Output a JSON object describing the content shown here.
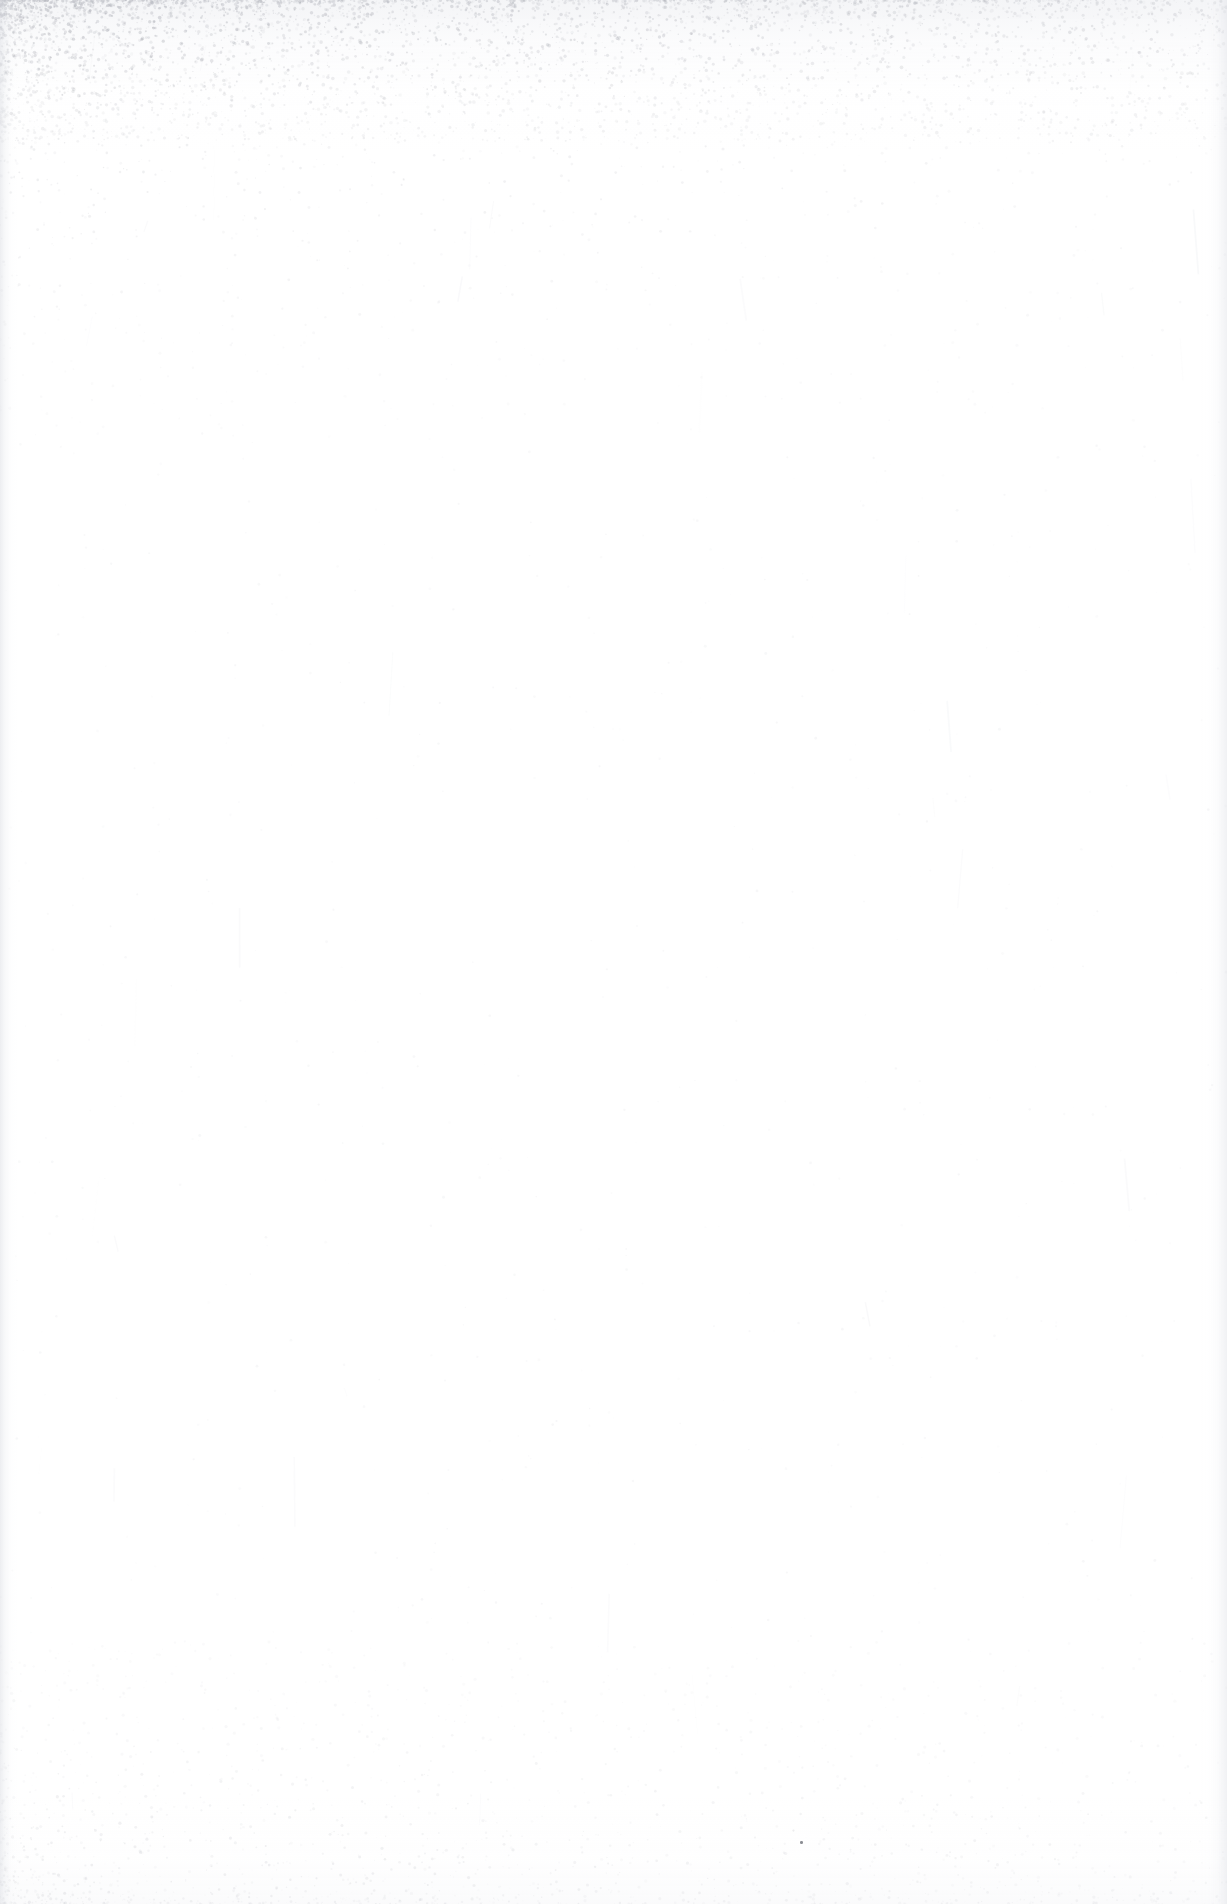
{
  "page": {
    "kind": "scanned-blank-page",
    "width": 1227,
    "height": 1904,
    "paper_color": "#fefefe",
    "base_white": "#ffffff",
    "vignette_color": "#fbfbfc",
    "text_content": "",
    "visible_labels": []
  },
  "artifacts": {
    "gutter_left": {
      "name": "binding-gutter-shadow",
      "edge": "left",
      "width_px": 18,
      "color": "#dee0e5",
      "opacity": 0.55
    },
    "edge_right": {
      "name": "page-edge-shadow",
      "edge": "right",
      "width_px": 26,
      "color": "#e2e4e9",
      "opacity": 0.5
    },
    "top_wash": {
      "name": "top-edge-wash",
      "height_px": 150,
      "color": "#e4e6eb",
      "opacity": 0.42
    },
    "bottom_wash": {
      "name": "bottom-edge-wash",
      "height_px": 110,
      "color": "#f0f1f4",
      "opacity": 0.3
    },
    "dust_speck": {
      "name": "dust-speck",
      "x": 800,
      "y": 1841,
      "size_px": 3,
      "color": "#8d8f95"
    }
  },
  "speckle": {
    "seed": 20240917,
    "bands": [
      {
        "name": "top-dense-speckle",
        "y_start": 0,
        "y_end": 138,
        "count": 5200,
        "color": "#8e9099",
        "min_alpha": 0.06,
        "max_alpha": 0.52,
        "max_radius": 1.5,
        "x_bias": "left",
        "fade": "downward"
      },
      {
        "name": "upper-sparse-speckle",
        "y_start": 138,
        "y_end": 430,
        "count": 760,
        "color": "#a9abb3",
        "min_alpha": 0.04,
        "max_alpha": 0.22,
        "max_radius": 1.2,
        "x_bias": "left",
        "fade": "downward"
      },
      {
        "name": "body-faint-speckle",
        "y_start": 430,
        "y_end": 1640,
        "count": 620,
        "color": "#c3c5cc",
        "min_alpha": 0.03,
        "max_alpha": 0.14,
        "max_radius": 1.1,
        "x_bias": "none",
        "fade": "none"
      },
      {
        "name": "bottom-light-speckle",
        "y_start": 1640,
        "y_end": 1904,
        "count": 1850,
        "color": "#aaacb4",
        "min_alpha": 0.04,
        "max_alpha": 0.26,
        "max_radius": 1.3,
        "x_bias": "left",
        "fade": "upward"
      }
    ],
    "fiber_streaks": {
      "name": "paper-fiber-streaks",
      "count": 40,
      "color": "#e6e7ec",
      "max_alpha": 0.3
    }
  }
}
